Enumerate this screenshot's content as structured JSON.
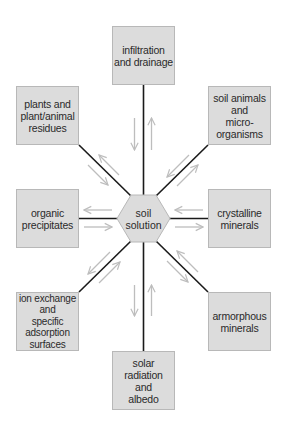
{
  "diagram": {
    "title": "",
    "center": {
      "label": "soil\nsolution",
      "shape": "hexagon"
    },
    "nodes": [
      {
        "id": "top",
        "label": "infiltration\nand drainage"
      },
      {
        "id": "upper_left",
        "label": "plants and\nplant/animal\nresidues"
      },
      {
        "id": "upper_right",
        "label": "soil animals\nand\nmicro-\norganisms"
      },
      {
        "id": "left",
        "label": "organic\nprecipitates"
      },
      {
        "id": "right",
        "label": "crystalline\nminerals"
      },
      {
        "id": "lower_left",
        "label": "ion exchange\nand\nspecific\nadsorption\nsurfaces"
      },
      {
        "id": "lower_right",
        "label": "armorphous\nminerals"
      },
      {
        "id": "bottom",
        "label": "solar\nradiation\nand\nalbedo"
      }
    ],
    "edges": [
      {
        "from": "soil solution",
        "to": "infiltration and drainage",
        "bidirectional": true
      },
      {
        "from": "soil solution",
        "to": "plants and plant/animal residues",
        "bidirectional": true
      },
      {
        "from": "soil solution",
        "to": "soil animals and micro-organisms",
        "bidirectional": true
      },
      {
        "from": "soil solution",
        "to": "organic precipitates",
        "bidirectional": true
      },
      {
        "from": "soil solution",
        "to": "crystalline minerals",
        "bidirectional": true
      },
      {
        "from": "soil solution",
        "to": "ion exchange and specific adsorption surfaces",
        "bidirectional": true
      },
      {
        "from": "soil solution",
        "to": "armorphous minerals",
        "bidirectional": true
      },
      {
        "from": "soil solution",
        "to": "solar radiation and albedo",
        "bidirectional": true
      }
    ],
    "colors": {
      "box_fill": "#dcdcdc",
      "box_border": "#b8b8b8",
      "connector": "#1a1a1a",
      "arrow": "#bdbdbd",
      "text": "#2a2a2a",
      "background": "#ffffff"
    }
  }
}
